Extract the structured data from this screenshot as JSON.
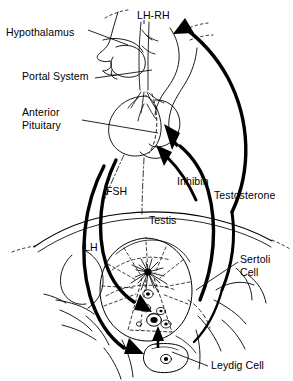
{
  "figure": {
    "background_color": "#ffffff",
    "stroke_color": "#000000",
    "labels": {
      "hypothalamus": "Hypothalamus",
      "lh_rh": "LH-RH",
      "portal_system": "Portal System",
      "anterior_pituitary_line1": "Anterior",
      "anterior_pituitary_line2": "Pituitary",
      "fsh": "FSH",
      "inhibin": "Inhibin",
      "testosterone": "Testosterone",
      "testis": "Testis",
      "lh": "LH",
      "sertoli_cell_line1": "Sertoli",
      "sertoli_cell_line2": "Cell",
      "leydig_cell": "Leydig Cell"
    },
    "hormone_arrows": [
      {
        "name": "LH-RH",
        "from": "hypothalamus",
        "to": "anterior-pituitary",
        "direction": "down"
      },
      {
        "name": "FSH",
        "from": "anterior-pituitary",
        "to": "sertoli-cell",
        "direction": "down"
      },
      {
        "name": "LH",
        "from": "anterior-pituitary",
        "to": "leydig-cell",
        "direction": "down"
      },
      {
        "name": "Inhibin",
        "from": "sertoli-cell",
        "to": "anterior-pituitary",
        "direction": "up"
      },
      {
        "name": "Testosterone",
        "from": "leydig-cell",
        "to": "hypothalamus",
        "direction": "up"
      }
    ],
    "anatomy": [
      "head-profile",
      "hypothalamus",
      "pituitary-stalk",
      "portal-system-vessels",
      "anterior-pituitary-lobe",
      "posterior-pituitary-lobe",
      "pelvis-outline",
      "testis",
      "seminiferous-tubules",
      "rete-testis",
      "sertoli-cell",
      "leydig-cell",
      "epididymis"
    ]
  }
}
